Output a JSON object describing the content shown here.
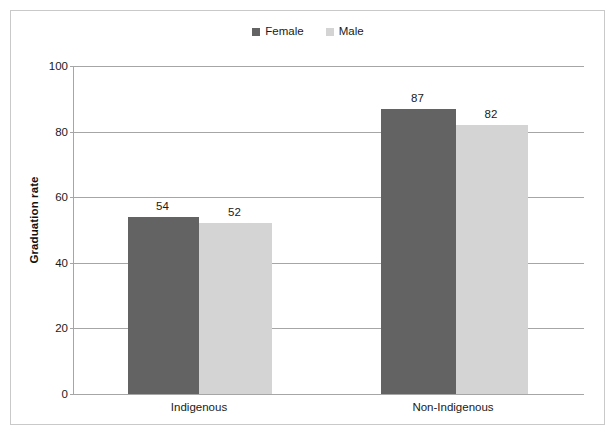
{
  "chart_data": {
    "type": "bar",
    "title": "",
    "xlabel": "",
    "ylabel": "Graduation rate",
    "categories": [
      "Indigenous",
      "Non-Indigenous"
    ],
    "series": [
      {
        "name": "Female",
        "color": "#636363",
        "values": [
          54,
          87
        ]
      },
      {
        "name": "Male",
        "color": "#d4d4d4",
        "values": [
          52,
          82
        ]
      }
    ],
    "ylim": [
      0,
      100
    ],
    "yticks": [
      0,
      20,
      40,
      60,
      80,
      100
    ],
    "ytick_labels": [
      "0",
      "20",
      "40",
      "60",
      "80",
      "100"
    ],
    "data_labels": [
      [
        "54",
        "52"
      ],
      [
        "87",
        "82"
      ]
    ],
    "grid": true,
    "legend_position": "top-center"
  },
  "legend": {
    "entries": [
      {
        "label": "Female",
        "color": "#636363"
      },
      {
        "label": "Male",
        "color": "#d4d4d4"
      }
    ]
  },
  "axis": {
    "y_title": "Graduation rate",
    "y_tick_labels": [
      "100",
      "80",
      "60",
      "40",
      "20",
      "0"
    ],
    "x_tick_labels": [
      "Indigenous",
      "Non-Indigenous"
    ]
  },
  "colors": {
    "female_bar": "#636363",
    "male_bar": "#d4d4d4",
    "gridline": "#a6a6a6",
    "frame": "#c9c9c9",
    "text": "#1a1a1a"
  }
}
